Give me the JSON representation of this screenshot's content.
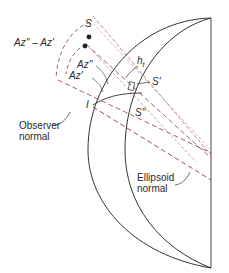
{
  "figure": {
    "type": "geodetic-diagram",
    "colors": {
      "outline": "#333333",
      "observer_normal": "#a0485a",
      "ellipsoid_normal": "#8a3a4a",
      "sight_lines": "#b07080"
    }
  },
  "labels": {
    "S": "S",
    "az_diff": "Az'' – Az'",
    "az_double": "Az''",
    "az_single": "Az'",
    "height": "h",
    "height_sub": "t",
    "S_prime": "S'",
    "S_double": "S''",
    "I": "I",
    "observer_normal_line1": "Observer",
    "observer_normal_line2": "normal",
    "ellipsoid_normal_line1": "Ellipsoid",
    "ellipsoid_normal_line2": "normal"
  }
}
